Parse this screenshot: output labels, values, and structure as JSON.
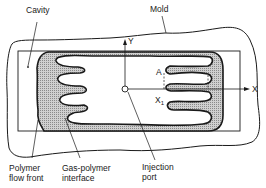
{
  "diagram": {
    "type": "gas-assisted injection molding cavity schematic",
    "labels": {
      "cavity": "Cavity",
      "mold": "Mold",
      "y_axis": "Y",
      "x_axis": "X",
      "point_a": "A",
      "x1_main": "X",
      "x1_sub": "1",
      "flow_front_line1": "Polymer",
      "flow_front_line2": "flow front",
      "interface_line1": "Gas-polymer",
      "interface_line2": "interface",
      "port_line1": "Injection",
      "port_line2": "port"
    },
    "colors": {
      "line": "#1a1a1a",
      "polymer_fill": "#bdbdbd",
      "gas_fill": "#ffffff",
      "background": "#ffffff"
    }
  }
}
